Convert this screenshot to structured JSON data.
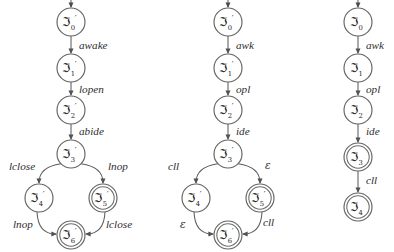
{
  "figure": {
    "background_color": "#ffffff",
    "stroke_color": "#5d5d5d",
    "text_color": "#1d1d1d",
    "state_symbol": "ℑ",
    "prime_symbol": "′"
  },
  "automata": [
    {
      "id": "automaton-left",
      "origin_x": 71,
      "states": [
        {
          "name": "state-0",
          "symbol": "ℑ",
          "subscript": "0",
          "prime": "′",
          "x": 71,
          "y": 22,
          "accepting": false,
          "start": true
        },
        {
          "name": "state-1",
          "symbol": "ℑ",
          "subscript": "1",
          "prime": "′",
          "x": 71,
          "y": 68,
          "accepting": false,
          "start": false
        },
        {
          "name": "state-2",
          "symbol": "ℑ",
          "subscript": "2",
          "prime": "′",
          "x": 71,
          "y": 110,
          "accepting": false,
          "start": false
        },
        {
          "name": "state-3",
          "symbol": "ℑ",
          "subscript": "3",
          "prime": "′",
          "x": 71,
          "y": 154,
          "accepting": false,
          "start": false
        },
        {
          "name": "state-4",
          "symbol": "ℑ",
          "subscript": "4",
          "prime": "′",
          "x": 39,
          "y": 198,
          "accepting": false,
          "start": false
        },
        {
          "name": "state-5",
          "symbol": "ℑ",
          "subscript": "5",
          "prime": "′",
          "x": 103,
          "y": 198,
          "accepting": true,
          "start": false
        },
        {
          "name": "state-6",
          "symbol": "ℑ",
          "subscript": "6",
          "prime": "′",
          "x": 71,
          "y": 235,
          "accepting": true,
          "start": false
        }
      ],
      "transitions": [
        {
          "name": "edge-0-1",
          "from": "state-0",
          "to": "state-1",
          "label": "awake",
          "label_x": 79,
          "label_y": 49,
          "kind": "straight"
        },
        {
          "name": "edge-1-2",
          "from": "state-1",
          "to": "state-2",
          "label": "lopen",
          "label_x": 79,
          "label_y": 93,
          "kind": "straight"
        },
        {
          "name": "edge-2-3",
          "from": "state-2",
          "to": "state-3",
          "label": "abide",
          "label_x": 79,
          "label_y": 135,
          "kind": "straight"
        },
        {
          "name": "edge-3-4",
          "from": "state-3",
          "to": "state-4",
          "label": "lclose",
          "label_x": 9,
          "label_y": 170,
          "kind": "curve-left"
        },
        {
          "name": "edge-3-5",
          "from": "state-3",
          "to": "state-5",
          "label": "lnop",
          "label_x": 108,
          "label_y": 170,
          "kind": "curve-right"
        },
        {
          "name": "edge-4-6",
          "from": "state-4",
          "to": "state-6",
          "label": "lnop",
          "label_x": 13,
          "label_y": 228,
          "kind": "curve-left-down"
        },
        {
          "name": "edge-5-6",
          "from": "state-5",
          "to": "state-6",
          "label": "lclose",
          "label_x": 106,
          "label_y": 228,
          "kind": "curve-right-down"
        }
      ]
    },
    {
      "id": "automaton-middle",
      "origin_x": 228,
      "states": [
        {
          "name": "state-0",
          "symbol": "ℑ",
          "subscript": "0",
          "prime": "′",
          "x": 228,
          "y": 22,
          "accepting": false,
          "start": true
        },
        {
          "name": "state-1",
          "symbol": "ℑ",
          "subscript": "1",
          "prime": "′",
          "x": 228,
          "y": 68,
          "accepting": false,
          "start": false
        },
        {
          "name": "state-2",
          "symbol": "ℑ",
          "subscript": "2",
          "prime": "′",
          "x": 228,
          "y": 110,
          "accepting": false,
          "start": false
        },
        {
          "name": "state-3",
          "symbol": "ℑ",
          "subscript": "3",
          "prime": "′",
          "x": 228,
          "y": 154,
          "accepting": false,
          "start": false
        },
        {
          "name": "state-4",
          "symbol": "ℑ",
          "subscript": "4",
          "prime": "′",
          "x": 196,
          "y": 198,
          "accepting": false,
          "start": false
        },
        {
          "name": "state-5",
          "symbol": "ℑ",
          "subscript": "5",
          "prime": "′",
          "x": 260,
          "y": 198,
          "accepting": true,
          "start": false
        },
        {
          "name": "state-6",
          "symbol": "ℑ",
          "subscript": "6",
          "prime": "′",
          "x": 228,
          "y": 235,
          "accepting": true,
          "start": false
        }
      ],
      "transitions": [
        {
          "name": "edge-0-1",
          "from": "state-0",
          "to": "state-1",
          "label": "awk",
          "label_x": 236,
          "label_y": 49,
          "kind": "straight"
        },
        {
          "name": "edge-1-2",
          "from": "state-1",
          "to": "state-2",
          "label": "opl",
          "label_x": 236,
          "label_y": 93,
          "kind": "straight"
        },
        {
          "name": "edge-2-3",
          "from": "state-2",
          "to": "state-3",
          "label": "ide",
          "label_x": 236,
          "label_y": 135,
          "kind": "straight"
        },
        {
          "name": "edge-3-4",
          "from": "state-3",
          "to": "state-4",
          "label": "cll",
          "label_x": 168,
          "label_y": 170,
          "kind": "curve-left"
        },
        {
          "name": "edge-3-5",
          "from": "state-3",
          "to": "state-5",
          "label": "ε",
          "label_x": 265,
          "label_y": 169,
          "kind": "curve-right"
        },
        {
          "name": "edge-4-6",
          "from": "state-4",
          "to": "state-6",
          "label": "ε",
          "label_x": 180,
          "label_y": 228,
          "kind": "curve-left-down"
        },
        {
          "name": "edge-5-6",
          "from": "state-5",
          "to": "state-6",
          "label": "cll",
          "label_x": 263,
          "label_y": 226,
          "kind": "curve-right-down"
        }
      ]
    },
    {
      "id": "automaton-right",
      "origin_x": 358,
      "states": [
        {
          "name": "state-0",
          "symbol": "ℑ",
          "subscript": "0",
          "prime": "",
          "x": 358,
          "y": 22,
          "accepting": false,
          "start": true
        },
        {
          "name": "state-1",
          "symbol": "ℑ",
          "subscript": "1",
          "prime": "",
          "x": 358,
          "y": 68,
          "accepting": false,
          "start": false
        },
        {
          "name": "state-2",
          "symbol": "ℑ",
          "subscript": "2",
          "prime": "",
          "x": 358,
          "y": 110,
          "accepting": false,
          "start": false
        },
        {
          "name": "state-3",
          "symbol": "ℑ",
          "subscript": "3",
          "prime": "",
          "x": 358,
          "y": 157,
          "accepting": true,
          "start": false
        },
        {
          "name": "state-4",
          "symbol": "ℑ",
          "subscript": "4",
          "prime": "",
          "x": 358,
          "y": 207,
          "accepting": true,
          "start": false
        }
      ],
      "transitions": [
        {
          "name": "edge-0-1",
          "from": "state-0",
          "to": "state-1",
          "label": "awk",
          "label_x": 366,
          "label_y": 49,
          "kind": "straight"
        },
        {
          "name": "edge-1-2",
          "from": "state-1",
          "to": "state-2",
          "label": "opl",
          "label_x": 366,
          "label_y": 93,
          "kind": "straight"
        },
        {
          "name": "edge-2-3",
          "from": "state-2",
          "to": "state-3",
          "label": "ide",
          "label_x": 366,
          "label_y": 135,
          "kind": "straight"
        },
        {
          "name": "edge-3-4",
          "from": "state-3",
          "to": "state-4",
          "label": "cll",
          "label_x": 366,
          "label_y": 184,
          "kind": "straight"
        }
      ]
    }
  ]
}
